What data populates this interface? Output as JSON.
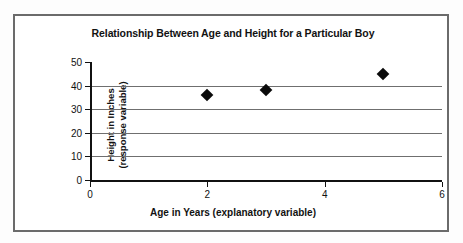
{
  "chart_data": {
    "type": "scatter",
    "title": "Relationship Between Age and Height for a Particular Boy",
    "xlabel": "Age in Years (explanatory variable)",
    "ylabel_line1": "Height in Inches",
    "ylabel_line2": "(response variable)",
    "x": [
      2,
      3,
      5
    ],
    "values": [
      36,
      38,
      45
    ],
    "points": [
      {
        "x": 2,
        "y": 36
      },
      {
        "x": 3,
        "y": 38
      },
      {
        "x": 5,
        "y": 45
      }
    ],
    "xlim": [
      0,
      6
    ],
    "ylim": [
      0,
      50
    ],
    "xticks": [
      "0",
      "2",
      "4",
      "6"
    ],
    "xtick_values": [
      0,
      2,
      4,
      6
    ],
    "yticks": [
      "0",
      "10",
      "20",
      "30",
      "40",
      "50"
    ],
    "ytick_values": [
      0,
      10,
      20,
      30,
      40,
      50
    ],
    "gridlines": [
      10,
      20,
      30,
      40
    ],
    "grid": true,
    "legend": null,
    "marker": "diamond",
    "marker_color": "#0a0a0a",
    "grid_color": "#6f6f6f",
    "axis_color": "#111111",
    "border_color": "#6b6b6b",
    "background_color": "#ffffff"
  }
}
